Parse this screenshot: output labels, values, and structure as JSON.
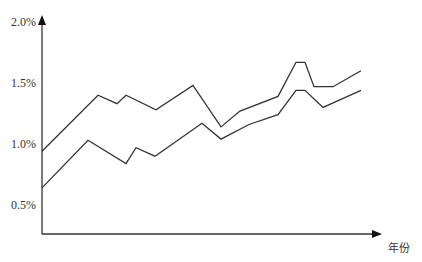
{
  "chart_data": {
    "type": "line",
    "title": "",
    "xlabel": "年份",
    "ylabel": "",
    "ylim": [
      0.2,
      2.0
    ],
    "yticks": [
      "0.5%",
      "1.0%",
      "1.5%",
      "2.0%"
    ],
    "ytick_values": [
      0.5,
      1.0,
      1.5,
      2.0
    ],
    "grid": false,
    "legend": null,
    "x_axis_ticks": [],
    "series": [
      {
        "name": "upper",
        "color": "#333333",
        "points": [
          [
            42,
            0.94
          ],
          [
            98,
            1.4
          ],
          [
            117,
            1.33
          ],
          [
            126,
            1.4
          ],
          [
            156,
            1.28
          ],
          [
            193,
            1.48
          ],
          [
            221,
            1.14
          ],
          [
            240,
            1.27
          ],
          [
            278,
            1.39
          ],
          [
            296,
            1.67
          ],
          [
            305,
            1.67
          ],
          [
            314,
            1.47
          ],
          [
            333,
            1.47
          ],
          [
            361,
            1.6
          ]
        ]
      },
      {
        "name": "lower",
        "color": "#333333",
        "points": [
          [
            42,
            0.64
          ],
          [
            88,
            1.03
          ],
          [
            126,
            0.84
          ],
          [
            136,
            0.97
          ],
          [
            155,
            0.9
          ],
          [
            202,
            1.17
          ],
          [
            221,
            1.04
          ],
          [
            249,
            1.16
          ],
          [
            278,
            1.24
          ],
          [
            296,
            1.44
          ],
          [
            305,
            1.44
          ],
          [
            323,
            1.3
          ],
          [
            361,
            1.44
          ]
        ]
      }
    ]
  },
  "layout": {
    "axis_color": "#333333",
    "origin_x": 42,
    "axis_y": 234,
    "axis_x_end": 382,
    "axis_y_top": 15,
    "px_per_unit": 122,
    "y_offset": 266
  }
}
